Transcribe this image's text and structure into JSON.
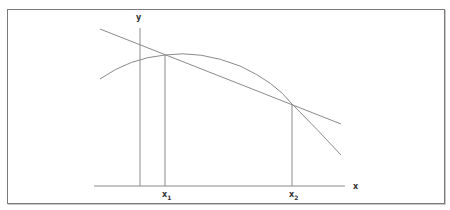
{
  "diagram": {
    "type": "secant-line-through-concave-curve",
    "axes": {
      "x_label": "x",
      "y_label": "y"
    },
    "points": [
      {
        "name": "x1",
        "base": "x",
        "subscript": "1"
      },
      {
        "name": "x2",
        "base": "x",
        "subscript": "2"
      }
    ],
    "elements": [
      "concave-down curve",
      "straight secant line intersecting curve at x1 and x2",
      "vertical drop lines from intersections to x-axis",
      "y-axis vertical line",
      "x-axis horizontal line"
    ],
    "colors": {
      "stroke": "#8a8a8a",
      "border": "#7a7a7a",
      "text": "#333333"
    }
  }
}
